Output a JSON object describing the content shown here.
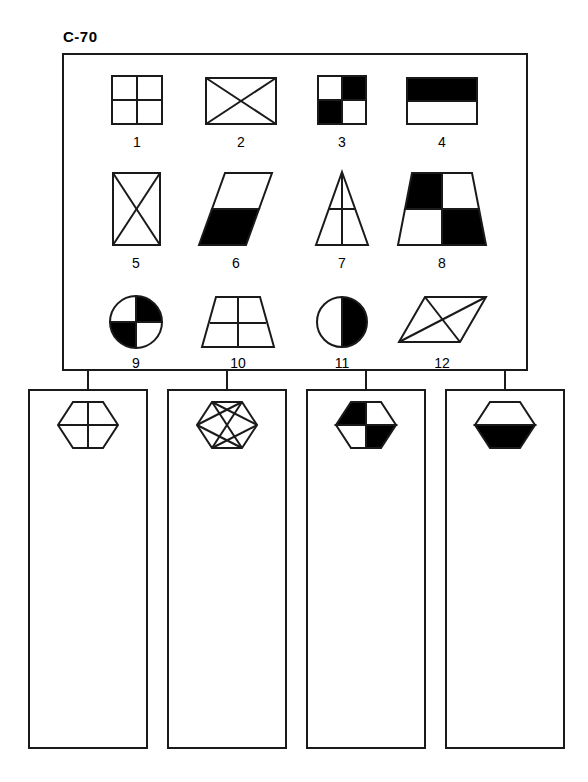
{
  "page": {
    "title": "C-70",
    "background_color": "#ffffff",
    "ink_color": "#1a1a1a",
    "fill_black": "#000000",
    "fill_white": "#ffffff"
  },
  "bank": {
    "name": "shape-bank",
    "items": [
      {
        "number": "1",
        "shape": "square",
        "pattern": "quartered-outline"
      },
      {
        "number": "2",
        "shape": "rectangle",
        "pattern": "x-diagonals"
      },
      {
        "number": "3",
        "shape": "square",
        "pattern": "checkerboard-white-first"
      },
      {
        "number": "4",
        "shape": "rectangle",
        "pattern": "top-half-black"
      },
      {
        "number": "5",
        "shape": "tall-rectangle",
        "pattern": "x-diagonals"
      },
      {
        "number": "6",
        "shape": "parallelogram",
        "pattern": "bottom-half-black"
      },
      {
        "number": "7",
        "shape": "triangle",
        "pattern": "cross-lines"
      },
      {
        "number": "8",
        "shape": "trapezoid",
        "pattern": "checkerboard-black-first"
      },
      {
        "number": "9",
        "shape": "circle",
        "pattern": "checkerboard-white-first"
      },
      {
        "number": "10",
        "shape": "trapezoid",
        "pattern": "cross-lines"
      },
      {
        "number": "11",
        "shape": "circle",
        "pattern": "right-half-black"
      },
      {
        "number": "12",
        "shape": "flat-parallelogram",
        "pattern": "x-diagonals"
      }
    ]
  },
  "columns": [
    {
      "name": "column-1",
      "header_shape": "hexagon",
      "header_pattern": "cross-lines",
      "answers": []
    },
    {
      "name": "column-2",
      "header_shape": "hexagon",
      "header_pattern": "x-diagonals",
      "answers": []
    },
    {
      "name": "column-3",
      "header_shape": "hexagon",
      "header_pattern": "checkerboard-black-first",
      "answers": []
    },
    {
      "name": "column-4",
      "header_shape": "hexagon",
      "header_pattern": "bottom-half-black",
      "answers": []
    }
  ]
}
